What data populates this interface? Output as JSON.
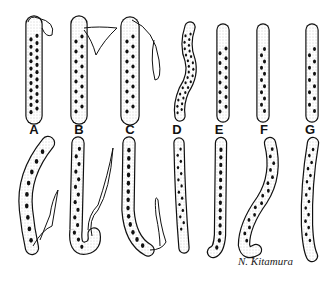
{
  "figure": {
    "labels": [
      "A",
      "B",
      "C",
      "D",
      "E",
      "F",
      "G"
    ],
    "signature": "N. Kitamura",
    "specimens": [
      {
        "label": "A",
        "anterior": "sheathed, detached sheath loop",
        "posterior": "sheathed, bent tail with sheath"
      },
      {
        "label": "B",
        "anterior": "sheathed, sheath flap",
        "posterior": "sheathed, hooked tail with sheath"
      },
      {
        "label": "C",
        "anterior": "sheathed, long sheath",
        "posterior": "sheathed, curved tail with sheath"
      },
      {
        "label": "D",
        "anterior": "wavy, dense nuclei",
        "posterior": "tapered tail"
      },
      {
        "label": "E",
        "anterior": "rounded head",
        "posterior": "tapered tail with nuclei to tip"
      },
      {
        "label": "F",
        "anterior": "rounded head",
        "posterior": "S-curved, hooked tail"
      },
      {
        "label": "G",
        "anterior": "rounded head",
        "posterior": "tapered, curved tail"
      }
    ]
  }
}
